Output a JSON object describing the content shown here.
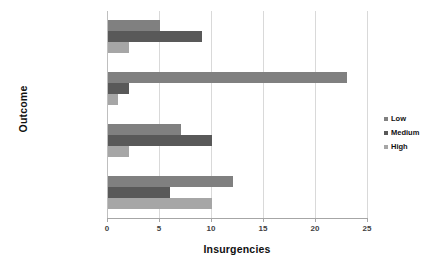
{
  "chart_data": {
    "type": "bar",
    "orientation": "horizontal",
    "title": "",
    "xlabel": "Insurgencies",
    "ylabel": "Outcome",
    "categories": [
      "Ongoing",
      "Government Loses",
      "Mixed Outcome",
      "Government Wins"
    ],
    "series": [
      {
        "name": "Low",
        "color": "#808080",
        "values": [
          5,
          23,
          7,
          12
        ]
      },
      {
        "name": "Medium",
        "color": "#595959",
        "values": [
          9,
          2,
          10,
          6
        ]
      },
      {
        "name": "High",
        "color": "#a6a6a6",
        "values": [
          2,
          1,
          2,
          10
        ]
      }
    ],
    "xlim": [
      0,
      25
    ],
    "xticks": [
      "0",
      "5",
      "10",
      "15",
      "20",
      "25"
    ],
    "xtick_values": [
      0,
      5,
      10,
      15,
      20,
      25
    ],
    "grid": "vertical",
    "legend_position": "right"
  },
  "legend": {
    "items": [
      {
        "label": "Low"
      },
      {
        "label": "Medium"
      },
      {
        "label": "High"
      }
    ]
  }
}
